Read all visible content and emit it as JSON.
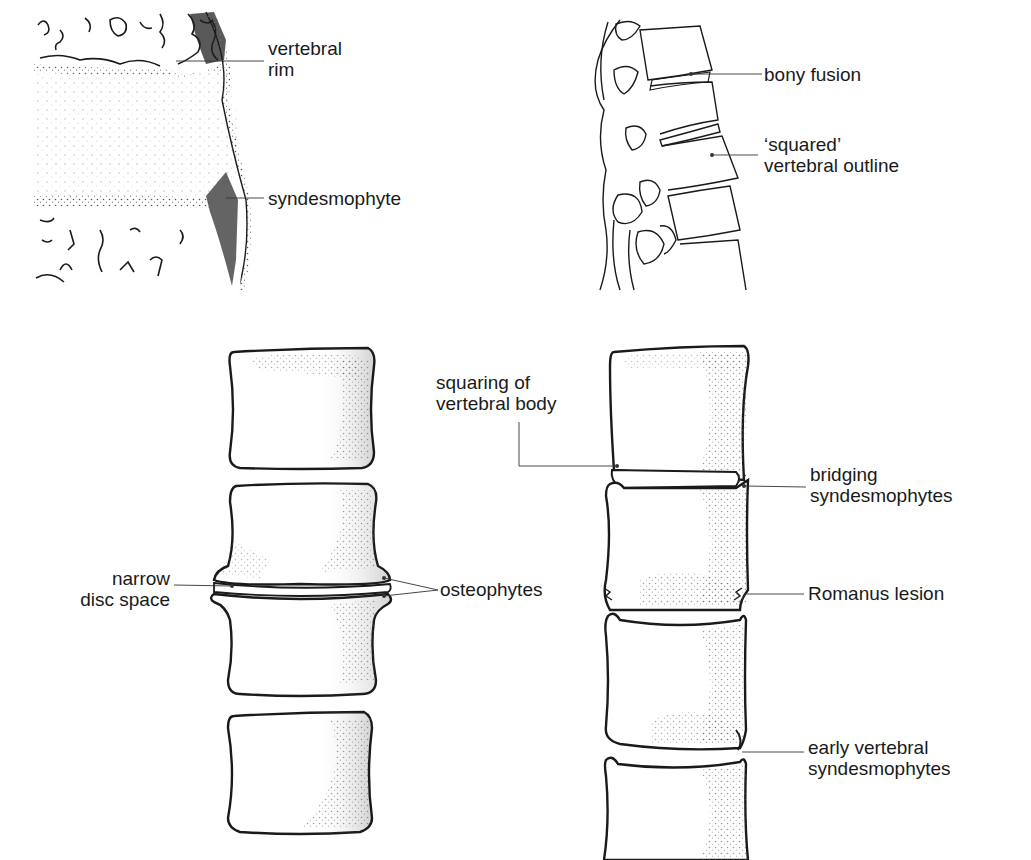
{
  "panels": {
    "top_left": {
      "title": "Vertebral margin detail",
      "labels": {
        "vertebral_rim": [
          "vertebral",
          "rim"
        ],
        "syndesmophyte": [
          "syndesmophyte"
        ]
      }
    },
    "top_right": {
      "title": "Lateral spine",
      "labels": {
        "bony_fusion": [
          "bony fusion"
        ],
        "squared_outline": [
          "‘squared’",
          "vertebral outline"
        ]
      }
    },
    "bottom_left": {
      "title": "Spondylosis",
      "labels": {
        "narrow_disc_space": [
          "narrow",
          "disc space"
        ],
        "osteophytes": [
          "osteophytes"
        ]
      }
    },
    "bottom_right": {
      "title": "Ankylosing spondylitis",
      "labels": {
        "squaring": [
          "squaring of",
          "vertebral body"
        ],
        "bridging": [
          "bridging",
          "syndesmophytes"
        ],
        "romanus": [
          "Romanus lesion"
        ],
        "early": [
          "early vertebral",
          "syndesmophytes"
        ]
      }
    }
  },
  "colors": {
    "ink": "#1a1a1a",
    "stipple": "#555555",
    "background": "#ffffff"
  }
}
